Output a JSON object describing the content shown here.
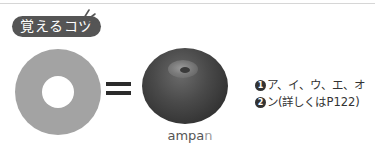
{
  "badge": {
    "label": "覚えるコツ"
  },
  "diagram": {
    "ring_color": "#a3a3a3",
    "equals_symbol": "=",
    "bun_image": "anpan-bun-photo",
    "caption_main": "ampa",
    "caption_dim": "n"
  },
  "notes": [
    {
      "number": "1",
      "text": "ア、イ、ウ、エ、オ"
    },
    {
      "number": "2",
      "text": "ン(詳しくはP122)"
    }
  ],
  "colors": {
    "badge_bg": "#555555",
    "text": "#333333",
    "caption": "#555555",
    "caption_dim": "#9a9a9a"
  }
}
